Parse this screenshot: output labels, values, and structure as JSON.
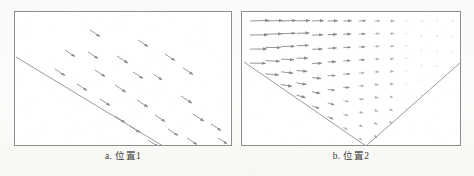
{
  "figure": {
    "kind": "vector-field-diagram",
    "background_color": "#fdfdfb",
    "panel_border_color": "#8d8d8d",
    "panel_fill_color": "#ffffff",
    "arrow_color": "#8a8a92",
    "boundary_line_color": "#9a9aa0"
  },
  "panels": [
    {
      "id": "panel-1",
      "caption": "a. 位置1",
      "description": "uniform vector field of down-right arrows above a single diagonal boundary line",
      "boundary_lines": [
        {
          "name": "diagonal-boundary",
          "x1": 1,
          "y1": 45,
          "x2": 148,
          "y2": 134
        }
      ],
      "arrows": [
        {
          "x": 75,
          "y": 18,
          "len": 12,
          "angle": 33
        },
        {
          "x": 123,
          "y": 28,
          "len": 12,
          "angle": 33
        },
        {
          "x": 50,
          "y": 38,
          "len": 12,
          "angle": 33
        },
        {
          "x": 73,
          "y": 40,
          "len": 12,
          "angle": 33
        },
        {
          "x": 102,
          "y": 44,
          "len": 13,
          "angle": 33
        },
        {
          "x": 150,
          "y": 42,
          "len": 12,
          "angle": 33
        },
        {
          "x": 40,
          "y": 57,
          "len": 12,
          "angle": 33
        },
        {
          "x": 80,
          "y": 58,
          "len": 12,
          "angle": 33
        },
        {
          "x": 118,
          "y": 60,
          "len": 12,
          "angle": 33
        },
        {
          "x": 138,
          "y": 62,
          "len": 11,
          "angle": 33
        },
        {
          "x": 62,
          "y": 72,
          "len": 12,
          "angle": 33
        },
        {
          "x": 100,
          "y": 73,
          "len": 13,
          "angle": 33
        },
        {
          "x": 168,
          "y": 56,
          "len": 12,
          "angle": 33
        },
        {
          "x": 85,
          "y": 87,
          "len": 12,
          "angle": 33
        },
        {
          "x": 122,
          "y": 88,
          "len": 13,
          "angle": 33
        },
        {
          "x": 166,
          "y": 84,
          "len": 13,
          "angle": 33
        },
        {
          "x": 100,
          "y": 104,
          "len": 12,
          "angle": 33
        },
        {
          "x": 140,
          "y": 103,
          "len": 12,
          "angle": 33
        },
        {
          "x": 178,
          "y": 102,
          "len": 13,
          "angle": 33
        },
        {
          "x": 115,
          "y": 114,
          "len": 12,
          "angle": 33
        },
        {
          "x": 153,
          "y": 117,
          "len": 12,
          "angle": 33
        },
        {
          "x": 196,
          "y": 112,
          "len": 12,
          "angle": 33
        },
        {
          "x": 133,
          "y": 128,
          "len": 12,
          "angle": 33
        },
        {
          "x": 172,
          "y": 126,
          "len": 12,
          "angle": 33
        },
        {
          "x": 203,
          "y": 126,
          "len": 11,
          "angle": 33
        }
      ]
    },
    {
      "id": "panel-2",
      "caption": "b. 位置2",
      "description": "converging vector field above a V-shaped boundary; long rightward arrows at upper-left decaying to small vectors at right",
      "boundary_lines": [
        {
          "name": "v-boundary-left",
          "x1": 2,
          "y1": 50,
          "x2": 124,
          "y2": 134
        },
        {
          "name": "v-boundary-right",
          "x1": 124,
          "y1": 134,
          "x2": 219,
          "y2": 50
        }
      ],
      "arrow_rows": 11,
      "arrow_cols": 14
    }
  ]
}
